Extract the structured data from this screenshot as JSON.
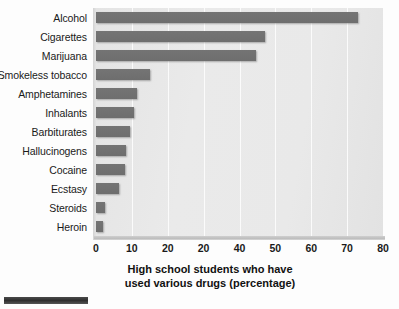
{
  "chart_data": {
    "type": "bar",
    "orientation": "horizontal",
    "title": "",
    "xlabel": "High school students who have used various drugs (percentage)",
    "xlabel_lines": [
      "High school students who have",
      "used various drugs (percentage)"
    ],
    "ylabel": "",
    "xlim": [
      0,
      80
    ],
    "ylim": null,
    "grid": "vertical-gridlines-white",
    "legend": "none",
    "tick_labels": [
      "0",
      "10",
      "20",
      "20",
      "40",
      "50",
      "60",
      "70",
      "80"
    ],
    "tick_values": [
      0,
      10,
      20,
      30,
      40,
      50,
      60,
      70,
      80
    ],
    "categories": [
      "Alcohol",
      "Cigarettes",
      "Marijuana",
      "Smokeless tobacco",
      "Amphetamines",
      "Inhalants",
      "Barbiturates",
      "Hallucinogens",
      "Cocaine",
      "Ecstasy",
      "Steroids",
      "Heroin"
    ],
    "values": [
      73,
      47,
      44.5,
      15,
      11.5,
      10.5,
      9.5,
      8.5,
      8,
      6.5,
      2.5,
      2
    ],
    "series": [
      {
        "name": "Percentage of high school students",
        "values": [
          73,
          47,
          44.5,
          15,
          11.5,
          10.5,
          9.5,
          8.5,
          8,
          6.5,
          2.5,
          2
        ]
      }
    ],
    "colors": {
      "bar": "#747474",
      "plot_background": "#e8e8e8",
      "gridline": "#fbfbfb",
      "text": "#1a1a1a",
      "page_background": "#fdfdfd",
      "artifact_bar": "#2f2f2f"
    }
  }
}
